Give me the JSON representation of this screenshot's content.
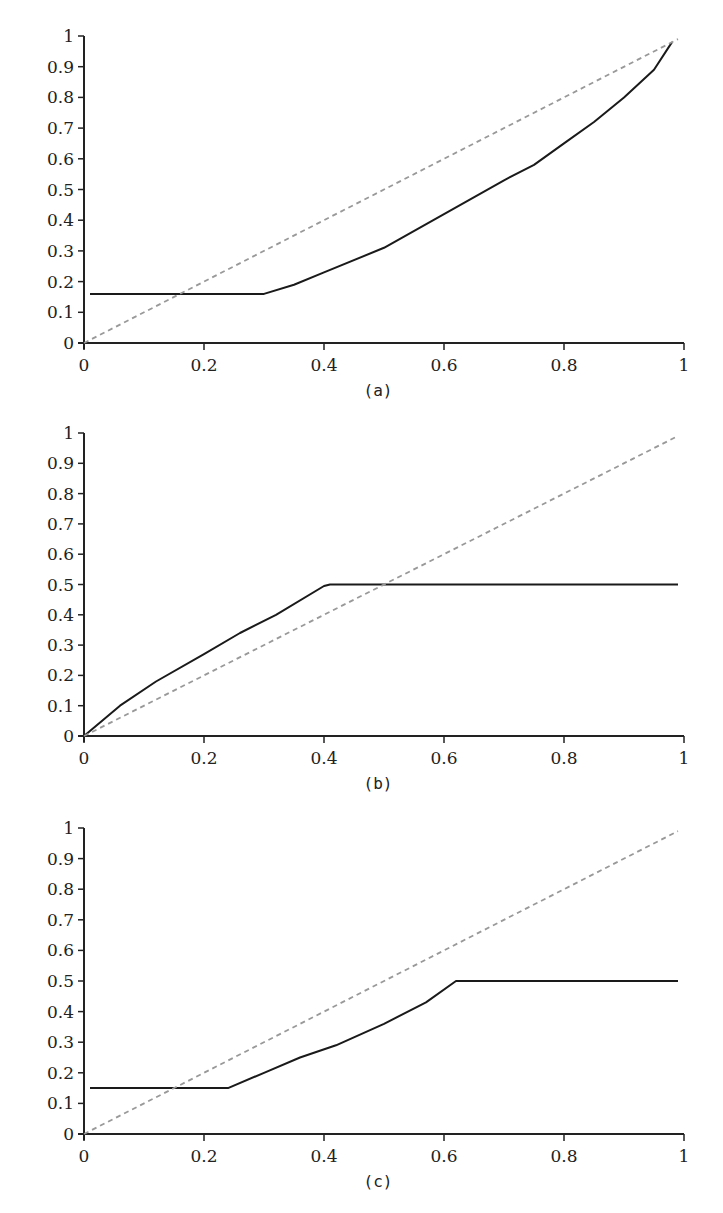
{
  "chart_data": [
    {
      "type": "line",
      "caption": "(a)",
      "xlim": [
        0,
        1
      ],
      "ylim": [
        0,
        1
      ],
      "x_ticks": [
        "0",
        "0.2",
        "0.4",
        "0.6",
        "0.8",
        "1"
      ],
      "y_ticks": [
        "0",
        "0.1",
        "0.2",
        "0.3",
        "0.4",
        "0.5",
        "0.6",
        "0.7",
        "0.8",
        "0.9",
        "1"
      ],
      "grid": false,
      "series": [
        {
          "name": "curve",
          "style": "solid",
          "color": "#1a1a1a",
          "x": [
            0.01,
            0.3,
            0.35,
            0.4,
            0.5,
            0.6,
            0.7,
            0.75,
            0.8,
            0.85,
            0.9,
            0.95,
            0.98
          ],
          "y": [
            0.16,
            0.16,
            0.19,
            0.23,
            0.31,
            0.42,
            0.53,
            0.58,
            0.65,
            0.72,
            0.8,
            0.89,
            0.98
          ]
        },
        {
          "name": "diagonal",
          "style": "dashed",
          "color": "#999999",
          "x": [
            0.0,
            0.99
          ],
          "y": [
            0.0,
            0.99
          ]
        }
      ]
    },
    {
      "type": "line",
      "caption": "(b)",
      "xlim": [
        0,
        1
      ],
      "ylim": [
        0,
        1
      ],
      "x_ticks": [
        "0",
        "0.2",
        "0.4",
        "0.6",
        "0.8",
        "1"
      ],
      "y_ticks": [
        "0",
        "0.1",
        "0.2",
        "0.3",
        "0.4",
        "0.5",
        "0.6",
        "0.7",
        "0.8",
        "0.9",
        "1"
      ],
      "grid": false,
      "series": [
        {
          "name": "curve",
          "style": "solid",
          "color": "#1a1a1a",
          "x": [
            0.0,
            0.06,
            0.12,
            0.2,
            0.26,
            0.32,
            0.4,
            0.41,
            0.99
          ],
          "y": [
            0.0,
            0.1,
            0.18,
            0.27,
            0.34,
            0.4,
            0.495,
            0.5,
            0.5
          ]
        },
        {
          "name": "diagonal",
          "style": "dashed",
          "color": "#999999",
          "x": [
            0.0,
            0.99
          ],
          "y": [
            0.0,
            0.99
          ]
        }
      ]
    },
    {
      "type": "line",
      "caption": "(c)",
      "xlim": [
        0,
        1
      ],
      "ylim": [
        0,
        1
      ],
      "x_ticks": [
        "0",
        "0.2",
        "0.4",
        "0.6",
        "0.8",
        "1"
      ],
      "y_ticks": [
        "0",
        "0.1",
        "0.2",
        "0.3",
        "0.4",
        "0.5",
        "0.6",
        "0.7",
        "0.8",
        "0.9",
        "1"
      ],
      "grid": false,
      "series": [
        {
          "name": "curve",
          "style": "solid",
          "color": "#1a1a1a",
          "x": [
            0.01,
            0.24,
            0.3,
            0.36,
            0.42,
            0.5,
            0.57,
            0.62,
            0.99
          ],
          "y": [
            0.15,
            0.15,
            0.2,
            0.25,
            0.29,
            0.36,
            0.43,
            0.5,
            0.5
          ]
        },
        {
          "name": "diagonal",
          "style": "dashed",
          "color": "#999999",
          "x": [
            0.0,
            0.99
          ],
          "y": [
            0.0,
            0.99
          ]
        }
      ]
    }
  ]
}
